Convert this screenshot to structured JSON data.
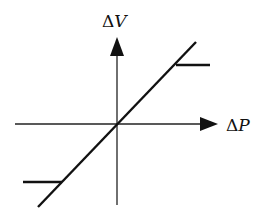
{
  "diagram": {
    "type": "transfer-characteristic",
    "labels": {
      "y_axis_delta": "Δ",
      "y_axis_var": "V",
      "x_axis_delta": "Δ",
      "x_axis_var": "P"
    },
    "geometry": {
      "origin": [
        117,
        124
      ],
      "x_axis": {
        "from": [
          15,
          124
        ],
        "to": [
          218,
          124
        ]
      },
      "y_axis": {
        "from": [
          117,
          205
        ],
        "to": [
          117,
          37
        ]
      },
      "diagonal": {
        "from": [
          38,
          207
        ],
        "to": [
          196,
          42
        ]
      },
      "upper_saturation": {
        "from": [
          176,
          65
        ],
        "to": [
          210,
          65
        ]
      },
      "lower_saturation": {
        "from": [
          23,
          182
        ],
        "to": [
          62,
          182
        ]
      }
    },
    "colors": {
      "stroke": "#111111",
      "background": "#ffffff"
    }
  }
}
